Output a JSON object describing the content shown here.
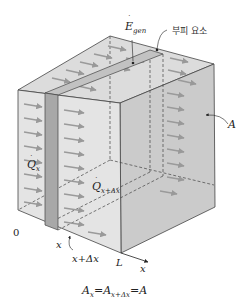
{
  "diagram": {
    "labels": {
      "egen": "E",
      "egen_sub": "gen",
      "volume_element": "부피 요소",
      "area": "A",
      "qx": "Q",
      "qx_sub": "x",
      "qxdx": "Q",
      "qxdx_sub": "x+Δx",
      "origin": "0",
      "x": "x",
      "x_plus_dx": "x+Δx",
      "L": "L",
      "axis": "x",
      "eq_a": "A",
      "eq_sub1": "x",
      "eq_eq1": "=",
      "eq_a2": "A",
      "eq_sub2": "x+Δx",
      "eq_eq2": "=",
      "eq_a3": "A"
    },
    "colors": {
      "front_face": "#e2e2e2",
      "top_face": "#d9d9d9",
      "right_face": "#c9c9c9",
      "slab": "#a9a9a9",
      "slab_top": "#c4c4c4",
      "arrow": "#999999",
      "edge": "#444444"
    }
  }
}
